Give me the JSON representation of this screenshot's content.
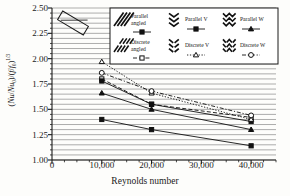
{
  "chart_data": {
    "type": "line",
    "title": "",
    "xlabel": "Reynolds number",
    "ylabel": "(Nu/Nu0)/(f/f0)^(1/3)",
    "x": [
      10000,
      20000,
      40000
    ],
    "xlim": [
      0,
      45000
    ],
    "ylim": [
      1.0,
      2.5
    ],
    "xticks": [
      0,
      10000,
      20000,
      30000,
      40000
    ],
    "xticklabels": [
      "0",
      "10,000",
      "20,000",
      "30,000",
      "40,000"
    ],
    "yticks": [
      1.0,
      1.25,
      1.5,
      1.75,
      2.0,
      2.25,
      2.5
    ],
    "yticklabels": [
      "1.00",
      "1.25",
      "1.50",
      "1.75",
      "2.00",
      "2.25",
      "2.50"
    ],
    "grid": "horizontal-dense",
    "legend_position": "top-right-overlay",
    "series": [
      {
        "name": "Parallel angled",
        "values": [
          1.4,
          1.3,
          1.14
        ],
        "marker": "filled-square",
        "line": "solid",
        "pattern": "angled-hatch"
      },
      {
        "name": "Discrete angled",
        "values": [
          1.8,
          1.55,
          1.42
        ],
        "marker": "open-square",
        "line": "dashed",
        "pattern": "angled-hatch-broken"
      },
      {
        "name": "Parallel V",
        "values": [
          1.78,
          1.55,
          1.38
        ],
        "marker": "filled-square",
        "line": "solid",
        "pattern": "chevron-v"
      },
      {
        "name": "Discrete V",
        "values": [
          1.97,
          1.66,
          1.4
        ],
        "marker": "open-triangle",
        "line": "dotted",
        "pattern": "chevron-v-broken"
      },
      {
        "name": "Parallel W",
        "values": [
          1.66,
          1.5,
          1.3
        ],
        "marker": "filled-triangle",
        "line": "solid",
        "pattern": "zigzag-w"
      },
      {
        "name": "Discrete W",
        "values": [
          1.86,
          1.68,
          1.44
        ],
        "marker": "open-circle",
        "line": "dash-dot",
        "pattern": "zigzag-w-broken"
      }
    ],
    "annotations": [
      {
        "name": "angled-rib-box",
        "shape": "rotated-rectangle"
      }
    ]
  },
  "axes": {
    "ylabel_html": "(<i>Nu</i>/<i>Nu</i><sub>0</sub>)/(<i>f</i>/<i>f</i><sub>0</sub>)<sup>1/3</sup>",
    "xlabel": "Reynolds number"
  },
  "legend": {
    "entries": [
      {
        "label_line1": "Parallel",
        "label_line2": "angled"
      },
      {
        "label_line1": "Parallel V",
        "label_line2": ""
      },
      {
        "label_line1": "Parallel W",
        "label_line2": ""
      },
      {
        "label_line1": "Discrete",
        "label_line2": "angled"
      },
      {
        "label_line1": "Discrete V",
        "label_line2": ""
      },
      {
        "label_line1": "Discrete W",
        "label_line2": ""
      }
    ]
  },
  "colors": {
    "axis": "#1a1a1a",
    "grid": "#8a8a8a",
    "marker_fill": "#111111",
    "marker_open": "#ffffff",
    "background": "#fdfdfb"
  }
}
